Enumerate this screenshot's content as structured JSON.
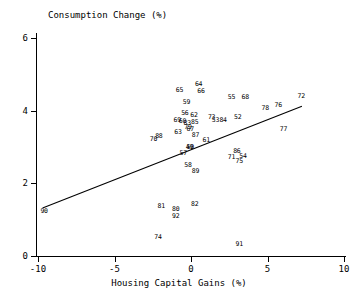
{
  "chart_data": {
    "type": "scatter",
    "title": "Consumption Change (%)",
    "xlabel": "Housing Capital Gains (%)",
    "ylabel": "",
    "xlim": [
      -10,
      10
    ],
    "ylim": [
      0,
      6
    ],
    "grid": false,
    "legend": null,
    "xticks": [
      -10,
      -5,
      0,
      5,
      10
    ],
    "xtick_labels": [
      "-10",
      "-5",
      "0",
      "5",
      "10"
    ],
    "yticks": [
      0,
      2,
      4,
      6
    ],
    "ytick_labels": [
      "0",
      "2",
      "4",
      "6"
    ],
    "point_style": "text-labels",
    "points": [
      {
        "label": "64",
        "x": 0.55,
        "y": 4.72
      },
      {
        "label": "65",
        "x": -0.7,
        "y": 4.55
      },
      {
        "label": "66",
        "x": 0.7,
        "y": 4.52
      },
      {
        "label": "55",
        "x": 2.7,
        "y": 4.37
      },
      {
        "label": "68",
        "x": 3.6,
        "y": 4.37
      },
      {
        "label": "72",
        "x": 7.25,
        "y": 4.4
      },
      {
        "label": "59",
        "x": -0.25,
        "y": 4.22
      },
      {
        "label": "76",
        "x": 5.75,
        "y": 4.15
      },
      {
        "label": "78",
        "x": 4.9,
        "y": 4.05
      },
      {
        "label": "56",
        "x": -0.35,
        "y": 3.92
      },
      {
        "label": "62",
        "x": 0.25,
        "y": 3.88
      },
      {
        "label": "73",
        "x": 1.4,
        "y": 3.8
      },
      {
        "label": "52",
        "x": 3.1,
        "y": 3.8
      },
      {
        "label": "69",
        "x": -0.85,
        "y": 3.73
      },
      {
        "label": "60",
        "x": -0.5,
        "y": 3.7
      },
      {
        "label": "53",
        "x": 1.65,
        "y": 3.72
      },
      {
        "label": "84",
        "x": 2.15,
        "y": 3.73
      },
      {
        "label": "83",
        "x": -0.2,
        "y": 3.66
      },
      {
        "label": "85",
        "x": 0.3,
        "y": 3.68
      },
      {
        "label": "79",
        "x": -0.15,
        "y": 3.55
      },
      {
        "label": "63",
        "x": -0.8,
        "y": 3.4
      },
      {
        "label": "67",
        "x": 0.0,
        "y": 3.47
      },
      {
        "label": "87",
        "x": 0.35,
        "y": 3.32
      },
      {
        "label": "77",
        "x": 6.1,
        "y": 3.47
      },
      {
        "label": "70",
        "x": -2.4,
        "y": 3.22
      },
      {
        "label": "88",
        "x": -2.05,
        "y": 3.28
      },
      {
        "label": "61",
        "x": 1.05,
        "y": 3.18
      },
      {
        "label": "49",
        "x": -0.05,
        "y": 3.0
      },
      {
        "label": "50",
        "x": 0.0,
        "y": 2.98
      },
      {
        "label": "57",
        "x": -0.45,
        "y": 2.83
      },
      {
        "label": "86",
        "x": 3.05,
        "y": 2.87
      },
      {
        "label": "71",
        "x": 2.7,
        "y": 2.72
      },
      {
        "label": "54",
        "x": 3.45,
        "y": 2.75
      },
      {
        "label": "75",
        "x": 3.2,
        "y": 2.6
      },
      {
        "label": "58",
        "x": -0.15,
        "y": 2.5
      },
      {
        "label": "89",
        "x": 0.35,
        "y": 2.33
      },
      {
        "label": "82",
        "x": 0.3,
        "y": 1.42
      },
      {
        "label": "81",
        "x": -1.9,
        "y": 1.35
      },
      {
        "label": "80",
        "x": -0.95,
        "y": 1.27
      },
      {
        "label": "92",
        "x": -0.95,
        "y": 1.08
      },
      {
        "label": "90",
        "x": -9.55,
        "y": 1.22
      },
      {
        "label": "74",
        "x": -2.1,
        "y": 0.52
      },
      {
        "label": "91",
        "x": 3.2,
        "y": 0.32
      }
    ],
    "fit_line": {
      "x_start": -9.7,
      "y_start": 1.32,
      "x_end": 7.25,
      "y_end": 4.12,
      "slope": 0.165,
      "intercept": 2.92
    }
  }
}
